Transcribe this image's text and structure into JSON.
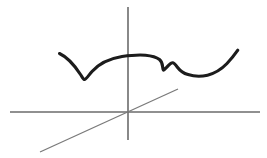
{
  "figure": {
    "background_color": "#ffffff",
    "width": 267,
    "height": 158
  },
  "colors": {
    "axis_stroke": "#6b6b6b",
    "diagonal_stroke": "#7a7a7a",
    "curve_stroke": "#1c1c1c",
    "background": "#ffffff"
  },
  "strokes": {
    "axis_width": 1.6,
    "diagonal_width": 1.3,
    "curve_width": 3.1
  },
  "elements": {
    "vertical_axis": {
      "label": "vertical axis",
      "x": 128,
      "y_top": 7,
      "y_bottom": 140
    },
    "horizontal_axis": {
      "label": "horizontal axis",
      "y": 112,
      "x_left": 10,
      "x_right": 260
    },
    "diagonal_line": {
      "label": "diagonal line through origin",
      "x1": 40,
      "y1": 152,
      "x2": 178,
      "y2": 89
    },
    "origin": {
      "label": "origin",
      "x": 128,
      "y": 112
    },
    "curve": {
      "label": "freehand curve",
      "path": "M 59.5 53.5 C 66 56.5, 74 64.5, 80.5 74.5 C 82.5 77.5, 83.5 79.5, 84.5 79.5 C 86 79.5, 88.5 75.5, 92 71.5 C 99 63.5, 110 58.5, 122 56.5 C 131 55.2, 139 54.6, 145.5 55.2 C 152 55.8, 156.5 57.2, 159.5 59.5 C 161.5 61.2, 162.3 63.8, 162.6 66.5 C 162.9 68.8, 163 70.2, 163.6 70.2 C 164.4 70.2, 166 67.8, 168 65.8 C 170 63.8, 171.6 62.6, 172.8 62.8 C 174.2 63.1, 175.6 64.8, 177.4 67.2 C 180 70.6, 183.5 73.2, 188 74.6 C 194 76.5, 201 76.8, 207.5 75.2 C 215 73.3, 221.5 69.2, 227 63.5 C 231.5 58.8, 235 54.2, 237.8 50.2",
      "features": [
        {
          "name": "left-start",
          "x": 59.5,
          "y": 53.5
        },
        {
          "name": "left-cusp-bottom",
          "x": 84.5,
          "y": 79.5
        },
        {
          "name": "plateau-peak",
          "x": 140,
          "y": 55
        },
        {
          "name": "notch-bottom",
          "x": 163.5,
          "y": 70
        },
        {
          "name": "notch-peak",
          "x": 172.5,
          "y": 62.8
        },
        {
          "name": "right-valley",
          "x": 197,
          "y": 76.5
        },
        {
          "name": "right-end",
          "x": 237.8,
          "y": 50.2
        }
      ]
    }
  }
}
